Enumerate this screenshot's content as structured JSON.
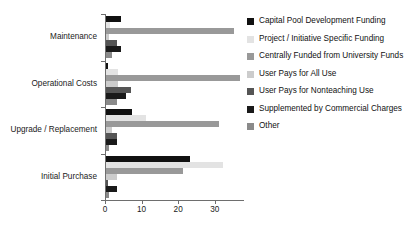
{
  "chart_data": {
    "type": "bar",
    "orientation": "horizontal",
    "title": "",
    "xlabel": "",
    "ylabel": "",
    "xlim": [
      0,
      38
    ],
    "xticks": [
      0,
      10,
      20,
      30
    ],
    "xtick_labels": [
      "0",
      "10",
      "20",
      "30"
    ],
    "grid": false,
    "legend_position": "right",
    "categories": [
      "Maintenance",
      "Operational Costs",
      "Upgrade / Replacement",
      "Initial Purchase"
    ],
    "series": [
      {
        "name": "Capital Pool Development Funding",
        "color": "#111111",
        "values": [
          4,
          0.6,
          7,
          23
        ]
      },
      {
        "name": "Project / Initiative Specific Funding",
        "color": "#e3e3e3",
        "values": [
          1.2,
          3.4,
          11,
          32
        ]
      },
      {
        "name": "Centrally Funded from University Funds",
        "color": "#999999",
        "values": [
          35,
          36.5,
          31,
          21
        ]
      },
      {
        "name": "User Pays for All Use",
        "color": "#cccccc",
        "values": [
          0.9,
          3.2,
          1.6,
          3
        ]
      },
      {
        "name": "User Pays for Nonteaching Use",
        "color": "#555555",
        "values": [
          3,
          6.7,
          3,
          0.5
        ]
      },
      {
        "name": "Supplemented by Commercial Charges",
        "color": "#1a1a1a",
        "values": [
          4,
          5.6,
          3,
          3
        ]
      },
      {
        "name": "Other",
        "color": "#8a8a8a",
        "values": [
          1.7,
          3,
          0.7,
          0.9
        ]
      }
    ]
  },
  "legend": {
    "items": [
      {
        "label": "Capital Pool Development Funding",
        "color": "#111111"
      },
      {
        "label": "Project / Initiative Specific Funding",
        "color": "#e3e3e3"
      },
      {
        "label": "Centrally Funded from University Funds",
        "color": "#999999"
      },
      {
        "label": "User Pays for All Use",
        "color": "#cccccc"
      },
      {
        "label": "User Pays for Nonteaching Use",
        "color": "#555555"
      },
      {
        "label": "Supplemented by Commercial Charges",
        "color": "#1a1a1a"
      },
      {
        "label": "Other",
        "color": "#8a8a8a"
      }
    ]
  },
  "axis": {
    "tick_labels": [
      "0",
      "10",
      "20",
      "30"
    ],
    "category_labels": [
      "Maintenance",
      "Operational Costs",
      "Upgrade / Replacement",
      "Initial Purchase"
    ]
  }
}
